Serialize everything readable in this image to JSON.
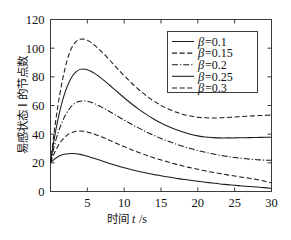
{
  "chart_data": {
    "type": "line",
    "title": "",
    "xlabel_cn": "时间",
    "xlabel_var": "t",
    "xlabel_unit": "/s",
    "ylabel": "易感状态 I 的节点数",
    "xlim": [
      0,
      30
    ],
    "ylim": [
      0,
      120
    ],
    "xticks": [
      0,
      5,
      10,
      15,
      20,
      25,
      30
    ],
    "xtick_labels": [
      "0",
      "5",
      "10",
      "15",
      "20",
      "25",
      "30"
    ],
    "yticks": [
      0,
      20,
      40,
      60,
      80,
      100,
      120
    ],
    "ytick_labels": [
      "0",
      "20",
      "40",
      "60",
      "80",
      "100",
      "120"
    ],
    "grid": false,
    "legend_position": "upper-right",
    "x": [
      0,
      0.5,
      1,
      1.5,
      2,
      2.5,
      3,
      3.5,
      4,
      4.5,
      5,
      5.5,
      6,
      7,
      8,
      9,
      10,
      11,
      12,
      13,
      14,
      15,
      16,
      17,
      18,
      19,
      20,
      21,
      22,
      23,
      24,
      25,
      26,
      27,
      28,
      29,
      30
    ],
    "series": [
      {
        "name": "β=0.1",
        "beta": 0.1,
        "style": "solid",
        "values": [
          20,
          22.4,
          24.2,
          25.4,
          26.1,
          26.4,
          26.5,
          26.3,
          25.9,
          25.3,
          24.6,
          23.8,
          23.0,
          21.3,
          19.6,
          18.0,
          16.5,
          15.2,
          14.0,
          12.9,
          11.9,
          11.0,
          10.1,
          9.3,
          8.5,
          7.8,
          7.1,
          6.5,
          5.9,
          5.3,
          4.8,
          4.3,
          3.9,
          3.5,
          3.1,
          2.7,
          2.2
        ]
      },
      {
        "name": "β=0.15",
        "beta": 0.15,
        "style": "dashed",
        "values": [
          20,
          26.5,
          31.6,
          35.4,
          38.2,
          40.2,
          41.4,
          42.0,
          42.2,
          42.0,
          41.5,
          40.8,
          40.0,
          38.0,
          35.8,
          33.5,
          31.3,
          29.2,
          27.2,
          25.3,
          23.6,
          22.0,
          20.5,
          19.1,
          17.8,
          16.6,
          15.5,
          14.4,
          13.4,
          12.5,
          11.6,
          10.8,
          10.0,
          9.2,
          8.3,
          7.3,
          6.0
        ]
      },
      {
        "name": "β=0.2",
        "beta": 0.2,
        "style": "dashdot",
        "values": [
          20,
          31.5,
          40.5,
          47.5,
          53.0,
          57.2,
          60.2,
          62.1,
          63.0,
          63.2,
          62.9,
          62.2,
          61.2,
          58.7,
          55.8,
          52.8,
          49.8,
          46.9,
          44.2,
          41.6,
          39.2,
          37.0,
          35.0,
          33.2,
          31.5,
          30.0,
          28.6,
          27.4,
          26.3,
          25.3,
          24.5,
          23.7,
          23.1,
          22.6,
          22.2,
          21.9,
          21.8
        ]
      },
      {
        "name": "β=0.25",
        "beta": 0.25,
        "style": "solid",
        "values": [
          20,
          36.5,
          50.0,
          61.0,
          69.5,
          76.0,
          80.7,
          83.6,
          85.2,
          85.5,
          85.0,
          83.9,
          82.4,
          78.6,
          74.3,
          69.8,
          65.4,
          61.2,
          57.3,
          53.8,
          50.6,
          47.8,
          45.4,
          43.3,
          41.5,
          40.0,
          38.8,
          38.0,
          37.6,
          37.4,
          37.4,
          37.4,
          37.5,
          37.6,
          37.7,
          37.8,
          37.9
        ]
      },
      {
        "name": "β=0.3",
        "beta": 0.3,
        "style": "dashed",
        "values": [
          20,
          41.5,
          59.5,
          74.5,
          86.5,
          95.5,
          101.5,
          104.8,
          106.2,
          106.3,
          105.5,
          104.0,
          102.0,
          97.2,
          91.8,
          86.2,
          80.8,
          75.7,
          71.0,
          66.8,
          63.2,
          60.1,
          57.5,
          55.4,
          53.8,
          52.6,
          51.8,
          51.4,
          51.3,
          51.4,
          51.7,
          52.0,
          52.3,
          52.6,
          52.9,
          53.1,
          53.3
        ]
      }
    ]
  },
  "legend": {
    "entries": [
      {
        "beta_symbol": "β",
        "label": "=0.1",
        "style": "solid"
      },
      {
        "beta_symbol": "β",
        "label": "=0.15",
        "style": "dashed"
      },
      {
        "beta_symbol": "β",
        "label": "=0.2",
        "style": "dashdot"
      },
      {
        "beta_symbol": "β",
        "label": "=0.25",
        "style": "solid"
      },
      {
        "beta_symbol": "β",
        "label": "=0.3",
        "style": "dashed"
      }
    ]
  },
  "colors": {
    "line": "#1a1a1a",
    "axis": "#3b3b3b",
    "text": "#111111",
    "background": "#ffffff"
  }
}
